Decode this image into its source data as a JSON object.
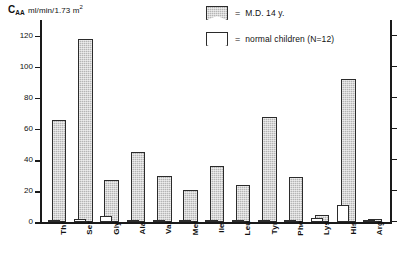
{
  "chart_data": {
    "type": "bar",
    "title": "",
    "ylabel": "C_AA  ml/min/1.73 m2",
    "xlabel": "",
    "ylim": [
      0,
      130
    ],
    "yticks": [
      0,
      20,
      40,
      60,
      80,
      100,
      120
    ],
    "ytick_labels": [
      "0",
      "20",
      "40",
      "60",
      "80",
      "100",
      "120"
    ],
    "grid": false,
    "legend_position": "top-right",
    "categories": [
      "Thr",
      "Ser",
      "Gly",
      "Ala",
      "Val",
      "Met",
      "Ile",
      "Leu",
      "Tyr",
      "Phe",
      "Lys",
      "His",
      "Arg"
    ],
    "series": [
      {
        "name": "M.D. 14 y.",
        "fill": "hatched-grey",
        "color": "#b5b5b5",
        "values": [
          66,
          118,
          27,
          45,
          30,
          21,
          36,
          24,
          68,
          29,
          5,
          92,
          2
        ]
      },
      {
        "name": "normal children (N=12)",
        "fill": "open-white",
        "color": "#ffffff",
        "values": [
          1.5,
          2,
          4,
          1.5,
          1.5,
          1.5,
          1.5,
          1.5,
          1.5,
          1.5,
          3,
          11,
          1
        ]
      }
    ]
  },
  "axis": {
    "y_title_main": "C",
    "y_title_sub": "AA",
    "y_title_units": "ml/min/1.73 m",
    "y_title_units_sup": "2"
  },
  "legend": {
    "equals": "=",
    "items": [
      {
        "label": "M.D. 14 y.",
        "swatch": "hatched-grey-swatch"
      },
      {
        "label": "normal children (N=12)",
        "swatch": "open-white-swatch"
      }
    ]
  }
}
